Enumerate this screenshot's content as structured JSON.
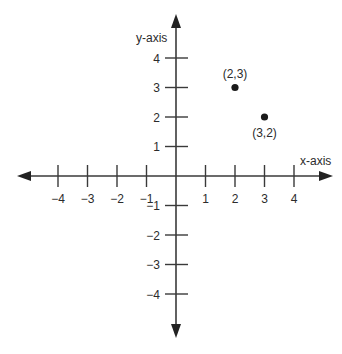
{
  "chart_data": {
    "type": "scatter",
    "title": "",
    "xlabel": "x-axis",
    "ylabel": "y-axis",
    "xlim": [
      -4,
      4
    ],
    "ylim": [
      -4,
      4
    ],
    "grid": false,
    "x_ticks": [
      -4,
      -3,
      -2,
      -1,
      1,
      2,
      3,
      4
    ],
    "y_ticks": [
      -4,
      -3,
      -2,
      -1,
      1,
      2,
      3,
      4
    ],
    "x_tick_labels": [
      "−4",
      "−3",
      "−2",
      "−1",
      "1",
      "2",
      "3",
      "4"
    ],
    "y_tick_labels": [
      "−4",
      "−3",
      "−2",
      "−1",
      "1",
      "2",
      "3",
      "4"
    ],
    "series": [
      {
        "name": "points",
        "points": [
          {
            "x": 2,
            "y": 3,
            "label": "(2,3)"
          },
          {
            "x": 3,
            "y": 2,
            "label": "(3,2)"
          }
        ]
      }
    ]
  },
  "axes": {
    "x_label": "x-axis",
    "y_label": "y-axis"
  },
  "colors": {
    "axis": "#3a3a3a",
    "point": "#1a1a1a",
    "text": "#2b2b2b",
    "background": "#ffffff"
  }
}
